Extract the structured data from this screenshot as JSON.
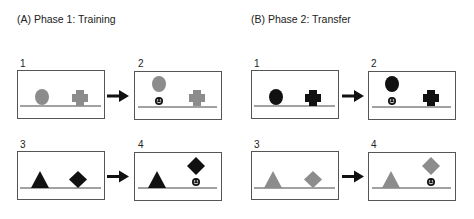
{
  "colors": {
    "gray": "#8c8c8c",
    "black": "#111111",
    "line": "#444444"
  },
  "sections": [
    {
      "id": "A",
      "title": "(A) Phase 1: Training",
      "shape_color": "black-or-gray",
      "panels": [
        {
          "num": "1",
          "left": "gray circle on ground",
          "right": "gray cross on ground",
          "reward": "none"
        },
        {
          "num": "2",
          "left": "gray circle lifted",
          "right": "gray cross on ground",
          "reward": "smiley under circle"
        },
        {
          "num": "3",
          "left": "black triangle on ground",
          "right": "black diamond on ground",
          "reward": "none"
        },
        {
          "num": "4",
          "left": "black triangle on ground",
          "right": "black diamond lifted",
          "reward": "smiley under diamond"
        }
      ]
    },
    {
      "id": "B",
      "title": "(B) Phase 2: Transfer",
      "panels": [
        {
          "num": "1",
          "left": "black circle on ground",
          "right": "black cross on ground",
          "reward": "none"
        },
        {
          "num": "2",
          "left": "black circle lifted",
          "right": "black cross on ground",
          "reward": "smiley under circle"
        },
        {
          "num": "3",
          "left": "gray triangle on ground",
          "right": "gray diamond on ground",
          "reward": "none"
        },
        {
          "num": "4",
          "left": "gray triangle on ground",
          "right": "gray diamond lifted",
          "reward": "smiley under diamond"
        }
      ]
    }
  ]
}
